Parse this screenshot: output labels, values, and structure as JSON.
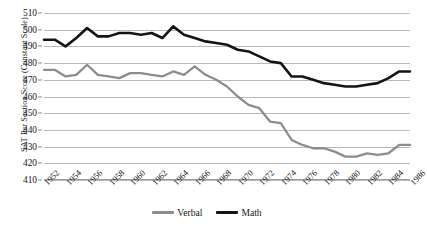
{
  "chart_data": {
    "type": "line",
    "title": "",
    "xlabel": "",
    "ylabel": "SAT Per Section Score (Constant Scale)",
    "ylim": [
      410,
      510
    ],
    "ytick_step": 10,
    "yticks": [
      410,
      420,
      430,
      440,
      450,
      460,
      470,
      480,
      490,
      500,
      510
    ],
    "grid": true,
    "legend_position": "bottom",
    "x": [
      1952,
      1953,
      1954,
      1955,
      1956,
      1957,
      1958,
      1959,
      1960,
      1961,
      1962,
      1963,
      1964,
      1965,
      1966,
      1967,
      1968,
      1969,
      1970,
      1971,
      1972,
      1973,
      1974,
      1975,
      1976,
      1977,
      1978,
      1979,
      1980,
      1981,
      1982,
      1983,
      1984,
      1985,
      1986
    ],
    "xtick_labels": [
      "1952",
      "1954",
      "1956",
      "1958",
      "1960",
      "1962",
      "1964",
      "1966",
      "1968",
      "1970",
      "1972",
      "1974",
      "1976",
      "1978",
      "1980",
      "1982",
      "1984",
      "1986"
    ],
    "series": [
      {
        "name": "Verbal",
        "color": "#8d8d8d",
        "values": [
          476,
          476,
          472,
          473,
          479,
          473,
          472,
          471,
          474,
          474,
          473,
          472,
          475,
          473,
          478,
          473,
          470,
          466,
          460,
          455,
          453,
          445,
          444,
          434,
          431,
          429,
          429,
          427,
          424,
          424,
          426,
          425,
          426,
          431,
          431
        ]
      },
      {
        "name": "Math",
        "color": "#141414",
        "values": [
          494,
          494,
          490,
          495,
          501,
          496,
          496,
          498,
          498,
          497,
          498,
          495,
          502,
          497,
          495,
          493,
          492,
          491,
          488,
          487,
          484,
          481,
          480,
          472,
          472,
          470,
          468,
          467,
          466,
          466,
          467,
          468,
          471,
          475,
          475
        ]
      }
    ]
  },
  "legend": {
    "items": [
      {
        "label": "Verbal",
        "color": "#8d8d8d"
      },
      {
        "label": "Math",
        "color": "#141414"
      }
    ]
  }
}
